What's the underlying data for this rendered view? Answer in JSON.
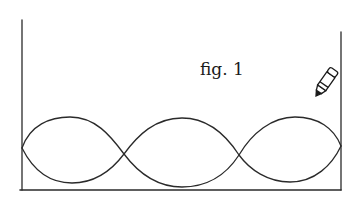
{
  "figure": {
    "caption": "fig. 1",
    "stroke_color": "#2a2a2a",
    "background": "#ffffff",
    "container": {
      "left_x": 22,
      "right_x": 341,
      "left_top_y": 20,
      "right_top_y": 32,
      "bottom_y": 190
    },
    "waves": {
      "loops": 3,
      "nodes_x": [
        22,
        124,
        239,
        341
      ],
      "node_y": [
        148,
        154,
        155,
        146
      ],
      "upper_peak_y": 118,
      "lower_trough_y": 183
    },
    "pencil": {
      "icon": "pencil-icon",
      "tip": [
        316,
        96
      ]
    }
  }
}
